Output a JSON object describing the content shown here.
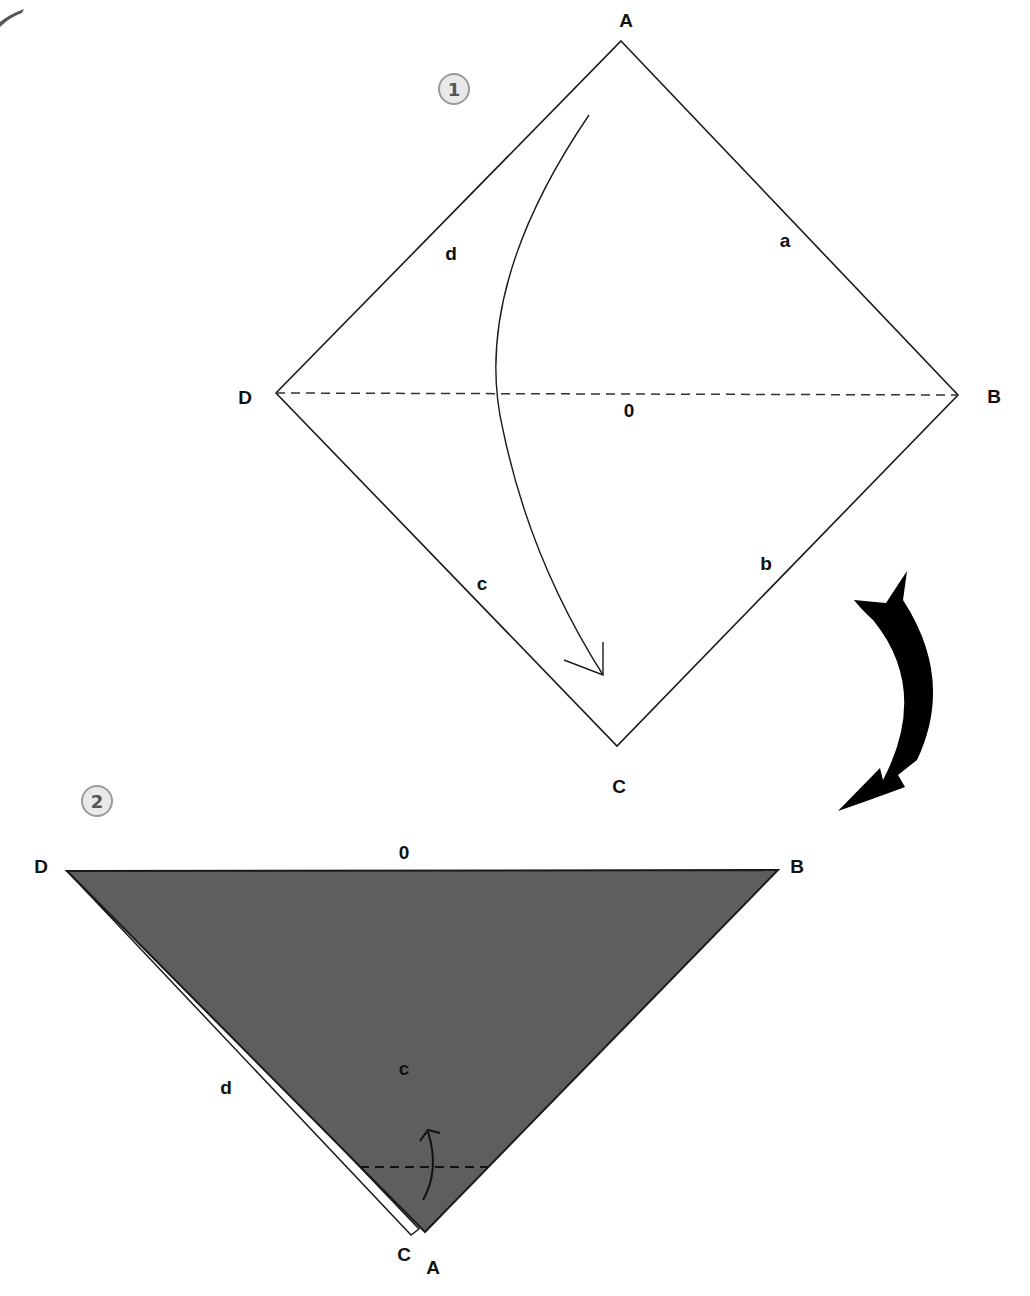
{
  "diagram": {
    "colors": {
      "background": "#ffffff",
      "line": "#1a1a1a",
      "paper_back": "#5e5e5e",
      "step_badge_fill": "#e9e9e9",
      "step_badge_border": "#9a9a9a",
      "transition_arrow": "#000000"
    },
    "steps": [
      {
        "number": "1",
        "shape": "square (diamond orientation)",
        "corners": {
          "top": "A",
          "right": "B",
          "bottom": "C",
          "left": "D"
        },
        "edges": {
          "top_right": "a",
          "bottom_right": "b",
          "bottom_left": "c",
          "top_left": "d"
        },
        "center_label": "0",
        "fold_line": "dashed valley fold D–B",
        "action": "fold corner A down to corner C"
      },
      {
        "number": "2",
        "shape": "triangle (folded in half)",
        "corners": {
          "left": "D",
          "right": "B",
          "bottom_back": "C",
          "bottom_front": "A"
        },
        "labels": {
          "top_edge": "0",
          "left_edge": "d",
          "face": "c"
        },
        "fold_line": "dashed fold near bottom tip",
        "action": "fold tip up"
      }
    ],
    "transition": "large curved arrow from step 1 to step 2"
  }
}
